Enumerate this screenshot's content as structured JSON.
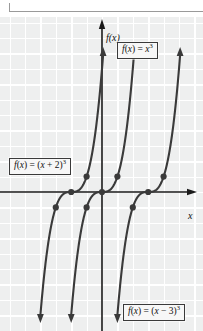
{
  "figure": {
    "kind": "cartesian-graph",
    "background_color": "#eeefef",
    "grid_color": "#ffffff",
    "curve_color": "#3a3a3a",
    "axis_color": "#1a1a1a",
    "label_box_fill": "#f7f7f7",
    "label_box_border": "#3a3a3a"
  },
  "axes": {
    "x_label": "x",
    "y_label": "f(x)",
    "origin_px": {
      "x": 102,
      "y": 175
    },
    "grid_spacing_px": 15.4,
    "x_axis_shown": true,
    "y_axis_shown": true,
    "tick_labels": []
  },
  "labels": {
    "cubed": {
      "lhs": "f(x)",
      "eq": " = ",
      "base": "x",
      "exp": "3",
      "full": "f(x) = x³"
    },
    "plus2": {
      "lhs": "f(x)",
      "eq": " = ",
      "base": "(x + 2)",
      "exp": "3",
      "full": "f(x) = (x + 2)³"
    },
    "minus3": {
      "lhs": "f(x)",
      "eq": " = ",
      "base": "(x − 3)",
      "exp": "3",
      "full": "f(x) = (x − 3)³"
    }
  },
  "chart_data": {
    "type": "line",
    "title": "",
    "xlabel": "x",
    "ylabel": "f(x)",
    "xlim": [
      -6.6,
      6.6
    ],
    "ylim": [
      -11.4,
      11.4
    ],
    "grid": true,
    "legend": "inline-boxed-labels",
    "series": [
      {
        "name": "f(x) = (x + 2)³",
        "equation": "(x+2)^3",
        "shift": -2,
        "x_intercept": -2,
        "color": "#3a3a3a",
        "markers_at_x": [
          -3,
          -2,
          -1
        ],
        "arrow_start": "down",
        "arrow_end": "up"
      },
      {
        "name": "f(x) = x³",
        "equation": "x^3",
        "shift": 0,
        "x_intercept": 0,
        "color": "#3a3a3a",
        "markers_at_x": [
          -1,
          0,
          1
        ],
        "arrow_start": "down",
        "arrow_end": "up"
      },
      {
        "name": "f(x) = (x − 3)³",
        "equation": "(x-3)^3",
        "shift": 3,
        "x_intercept": 3,
        "color": "#3a3a3a",
        "markers_at_x": [
          2,
          3,
          4
        ],
        "arrow_start": "down",
        "arrow_end": "up"
      }
    ]
  }
}
